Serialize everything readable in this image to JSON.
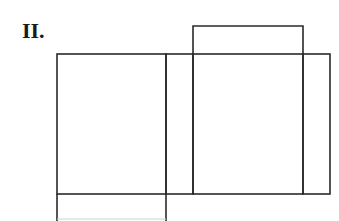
{
  "figure": {
    "label": "II.",
    "stroke_color": "#2a2a2a",
    "background_color": "#ffffff",
    "faces": [
      {
        "name": "front-face"
      },
      {
        "name": "narrow-side-face-left"
      },
      {
        "name": "back-face"
      },
      {
        "name": "narrow-side-face-right"
      },
      {
        "name": "top-flap"
      },
      {
        "name": "bottom-flap"
      }
    ]
  }
}
